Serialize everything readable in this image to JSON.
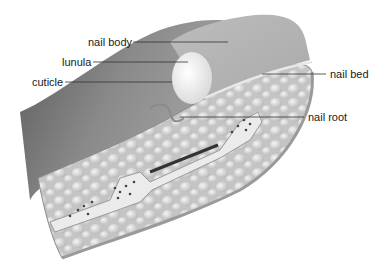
{
  "diagram": {
    "labels": [
      {
        "id": "nail-body",
        "text": "nail body",
        "x": 88,
        "y": 36,
        "line": [
          133,
          42,
          228,
          42
        ]
      },
      {
        "id": "lunula",
        "text": "lunula",
        "x": 62,
        "y": 56,
        "line": [
          93,
          62,
          188,
          62
        ]
      },
      {
        "id": "cuticle",
        "text": "cuticle",
        "x": 32,
        "y": 76,
        "line": [
          65,
          82,
          172,
          82
        ]
      },
      {
        "id": "nail-bed",
        "text": "nail bed",
        "x": 330,
        "y": 68,
        "line": [
          262,
          74,
          326,
          74
        ]
      },
      {
        "id": "nail-root",
        "text": "nail root",
        "x": 308,
        "y": 111,
        "line": [
          180,
          117,
          304,
          117
        ]
      }
    ],
    "colors": {
      "skin_dark": "#6e6e6e",
      "skin_light": "#b5b5b5",
      "nail": "#c9c9c9",
      "lunula": "#f2f2f2",
      "fat": "#d8d8d8",
      "bone": "#ebebeb",
      "line": "#333333"
    }
  }
}
